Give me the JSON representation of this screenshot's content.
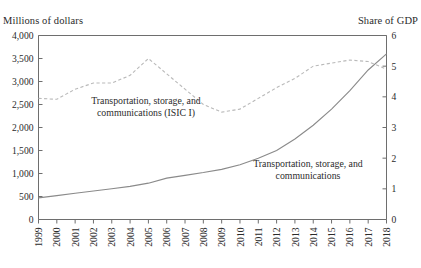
{
  "figure": {
    "title": "",
    "left_axis_title": "Millions of dollars",
    "right_axis_title": "Share of GDP"
  },
  "chart_data": {
    "type": "line",
    "title": "",
    "xlabel": "",
    "ylabel": "Millions of dollars",
    "y2label": "Share of GDP",
    "grid": false,
    "legend": "annotations-inline",
    "x": [
      1999,
      2000,
      2001,
      2002,
      2003,
      2004,
      2005,
      2006,
      2007,
      2008,
      2009,
      2010,
      2011,
      2012,
      2013,
      2014,
      2015,
      2016,
      2017,
      2018
    ],
    "xtick_labels": [
      "1999",
      "2000",
      "2001",
      "2002",
      "2003",
      "2004",
      "2005",
      "2006",
      "2007",
      "2008",
      "2009",
      "2010",
      "2011",
      "2012",
      "2013",
      "2014",
      "2015",
      "2016",
      "2017",
      "2018"
    ],
    "ylim": [
      0,
      4000
    ],
    "ytick_labels": [
      "0",
      "500",
      "1,000",
      "1,500",
      "2,000",
      "2,500",
      "3,000",
      "3,500",
      "4,000"
    ],
    "yticks": [
      0,
      500,
      1000,
      1500,
      2000,
      2500,
      3000,
      3500,
      4000
    ],
    "y2lim": [
      0,
      6
    ],
    "y2tick_labels": [
      "0",
      "1",
      "2",
      "3",
      "4",
      "5",
      "6"
    ],
    "y2ticks": [
      0,
      1,
      2,
      3,
      4,
      5,
      6
    ],
    "series": [
      {
        "name": "Transportation, storage, and communications",
        "axis": "left",
        "style": "solid",
        "color": "#8a8a8a",
        "values": [
          470,
          520,
          570,
          620,
          670,
          720,
          790,
          900,
          960,
          1020,
          1090,
          1190,
          1330,
          1500,
          1750,
          2050,
          2400,
          2800,
          3250,
          3600
        ]
      },
      {
        "name": "Transportation, storage, and communications (ISIC I)",
        "axis": "right",
        "style": "dashed",
        "color": "#b9b9b9",
        "values": [
          3.95,
          3.92,
          4.25,
          4.45,
          4.45,
          4.7,
          5.25,
          4.75,
          4.25,
          3.75,
          3.5,
          3.6,
          3.95,
          4.3,
          4.6,
          5.0,
          5.1,
          5.2,
          5.15,
          4.9
        ]
      }
    ],
    "annotations": [
      {
        "name": "dashed-series-label",
        "lines": [
          "Transportation, storage, and",
          "communications (ISIC I)"
        ],
        "x": 146,
        "y": 104
      },
      {
        "name": "solid-series-label",
        "lines": [
          "Transportation, storage, and",
          "communications"
        ],
        "x": 308,
        "y": 167
      }
    ]
  }
}
